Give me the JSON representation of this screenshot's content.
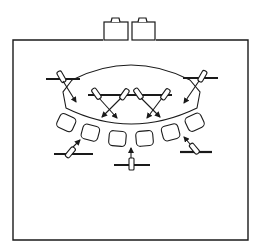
{
  "diagram": {
    "type": "line-drawing",
    "background": "#ffffff",
    "stroke": "#1a1a1a",
    "frame": {
      "x": 13,
      "y": 40,
      "w": 235,
      "h": 200
    },
    "top_boxes": [
      {
        "x": 104,
        "y": 20,
        "w": 24,
        "h": 20
      },
      {
        "x": 132,
        "y": 20,
        "w": 23,
        "h": 20
      }
    ],
    "stage_shape": "lens",
    "seat_count": 7,
    "fixtures": {
      "upper_bars": 3,
      "lower_bars": 3,
      "upper_fixture_count": 6,
      "lower_fixture_count": 3
    }
  }
}
